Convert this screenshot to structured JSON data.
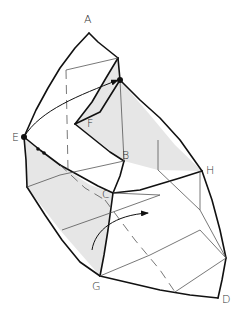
{
  "diagram": {
    "type": "folded-paper-geometry",
    "shade_color": "#e6e6e6",
    "line_color": "#111111",
    "thin_line_color": "#555555",
    "labels": [
      {
        "id": "A",
        "text": "A",
        "x": 84,
        "y": 12
      },
      {
        "id": "E",
        "text": "E",
        "x": 11,
        "y": 132
      },
      {
        "id": "F",
        "text": "F",
        "x": 88,
        "y": 120
      },
      {
        "id": "B",
        "text": "B",
        "x": 122,
        "y": 150
      },
      {
        "id": "C",
        "text": "C",
        "x": 103,
        "y": 190
      },
      {
        "id": "H",
        "text": "H",
        "x": 206,
        "y": 166
      },
      {
        "id": "G",
        "text": "G",
        "x": 91,
        "y": 280
      },
      {
        "id": "D",
        "text": "D",
        "x": 221,
        "y": 293
      }
    ],
    "markers": [
      {
        "name": "point-e",
        "x": 24,
        "y": 137
      },
      {
        "name": "point-fold",
        "x": 120,
        "y": 80
      }
    ],
    "arrows": [
      {
        "name": "fold-arrow-top",
        "from": "E",
        "to": "fold point"
      },
      {
        "name": "fold-arrow-bottom",
        "description": "curved arrow rotating right panel"
      }
    ]
  }
}
